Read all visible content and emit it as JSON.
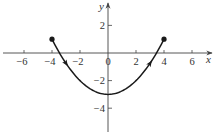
{
  "chart_data": {
    "type": "line",
    "title": "",
    "xlabel": "x",
    "ylabel": "y",
    "xlim": [
      -7.5,
      7.8
    ],
    "ylim": [
      -5.5,
      3.8
    ],
    "grid": false,
    "x_ticks": [
      -6,
      -4,
      -2,
      0,
      2,
      4,
      6
    ],
    "y_ticks": [
      2,
      -2,
      -4
    ],
    "x_tick_labels": [
      "−6",
      "−4",
      "−2",
      "0",
      "2",
      "4",
      "6"
    ],
    "y_tick_labels": [
      "2",
      "−2",
      "−4"
    ],
    "series": [
      {
        "name": "curve",
        "description": "parabolic arc y = x^2/4 - 3 from (-4, 1) to (4, 1), traversed left to right",
        "x": [
          -4,
          -3,
          -2,
          -1,
          0,
          1,
          2,
          3,
          4
        ],
        "y": [
          1,
          -0.75,
          -2,
          -2.75,
          -3,
          -2.75,
          -2,
          -0.75,
          1
        ],
        "start_point": [
          -4,
          1
        ],
        "end_point": [
          4,
          1
        ],
        "vertex": [
          0,
          -3
        ],
        "direction_arrows_at_x": [
          -3,
          3
        ],
        "endpoint_markers": "filled-circle"
      }
    ],
    "colors": {
      "axis": "#444444",
      "curve": "#1a1a1a",
      "text": "#333333"
    }
  }
}
